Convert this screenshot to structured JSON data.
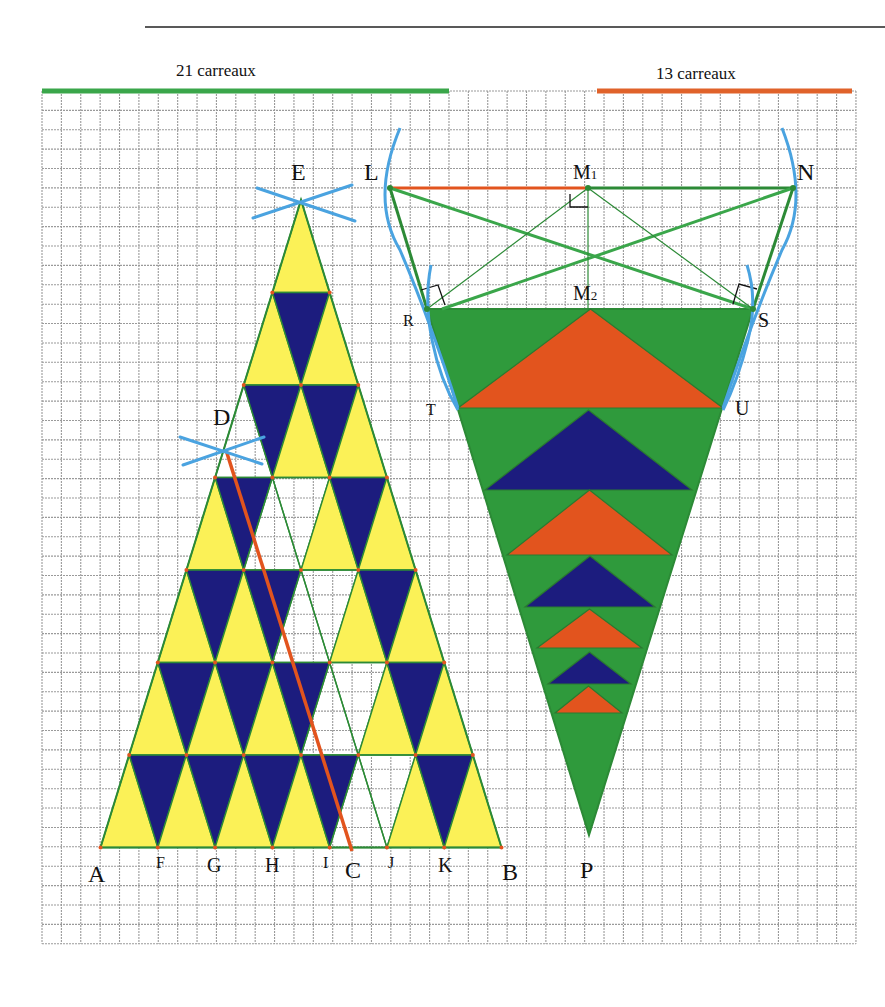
{
  "header": {
    "rule": {
      "x1": 145,
      "x2": 885,
      "y": 27
    },
    "scales": [
      {
        "label": "21 carreaux",
        "x1": 42,
        "x2": 449,
        "y": 91,
        "color": "#3aa64a",
        "label_x": 176,
        "label_y": 70
      },
      {
        "label": "13 carreaux",
        "x1": 597,
        "x2": 852,
        "y": 91,
        "color": "#e0622a",
        "label_x": 656,
        "label_y": 73
      }
    ]
  },
  "grid": {
    "x0": 42,
    "y0": 91,
    "cols": 42,
    "rows": 44,
    "cell": 19.38,
    "color": "#9a9a9a"
  },
  "colors": {
    "yellow": "#fbf157",
    "navy": "#1c1c7e",
    "green_fill": "#2f9a3c",
    "green_line": "#2c8a36",
    "orange": "#e2541e",
    "blue_arc": "#4aa3e0",
    "black": "#111111"
  },
  "left_figure": {
    "apex": {
      "x": 301,
      "y": 200
    },
    "row_height": 92.5,
    "half_step": 28.64,
    "rows": 7,
    "white_up": [
      [
        3,
        0
      ],
      [
        4,
        1
      ],
      [
        5,
        2
      ],
      [
        6,
        3
      ],
      [
        7,
        4
      ]
    ],
    "white_down": [
      [
        4,
        1
      ],
      [
        5,
        2
      ],
      [
        6,
        3
      ],
      [
        7,
        4
      ]
    ],
    "orange_line": {
      "x1": 226,
      "y1": 450,
      "x2": 352,
      "y2": 851
    },
    "arcs_E": [
      {
        "x1": 253,
        "y1": 218,
        "x2": 352,
        "y2": 185
      },
      {
        "x1": 257,
        "y1": 188,
        "x2": 355,
        "y2": 221
      }
    ],
    "arcs_D": [
      {
        "x1": 183,
        "y1": 465,
        "x2": 264,
        "y2": 437
      },
      {
        "x1": 180,
        "y1": 437,
        "x2": 262,
        "y2": 464
      }
    ]
  },
  "right_figure": {
    "L": {
      "x": 390,
      "y": 188
    },
    "M1": {
      "x": 588,
      "y": 188
    },
    "N": {
      "x": 793,
      "y": 188
    },
    "R": {
      "x": 427,
      "y": 309
    },
    "M2": {
      "x": 588,
      "y": 309
    },
    "S": {
      "x": 753,
      "y": 309
    },
    "T": {
      "x": 458,
      "y": 408
    },
    "U": {
      "x": 723,
      "y": 408
    },
    "P": {
      "x": 589,
      "y": 835
    },
    "inner_triangles": [
      {
        "apex_y": 309,
        "base_y": 408,
        "x1": 458,
        "x2": 723,
        "color": "orange"
      },
      {
        "apex_y": 410,
        "base_y": 490,
        "x1": 485,
        "x2": 692,
        "color": "navy"
      },
      {
        "apex_y": 490,
        "base_y": 555,
        "x1": 507,
        "x2": 672,
        "color": "orange"
      },
      {
        "apex_y": 556,
        "base_y": 607,
        "x1": 525,
        "x2": 655,
        "color": "navy"
      },
      {
        "apex_y": 609,
        "base_y": 648,
        "x1": 537,
        "x2": 642,
        "color": "orange"
      },
      {
        "apex_y": 652,
        "base_y": 684,
        "x1": 548,
        "x2": 631,
        "color": "navy"
      },
      {
        "apex_y": 686,
        "base_y": 713,
        "x1": 555,
        "x2": 622,
        "color": "orange"
      }
    ]
  },
  "labels": [
    {
      "id": "E",
      "text": "E",
      "x": 291,
      "y": 160,
      "size": "big"
    },
    {
      "id": "L",
      "text": "L",
      "x": 364,
      "y": 160,
      "size": "big"
    },
    {
      "id": "M1",
      "text": "M",
      "sub": "1",
      "x": 573,
      "y": 162,
      "size": "mid"
    },
    {
      "id": "N",
      "text": "N",
      "x": 797,
      "y": 160,
      "size": "big"
    },
    {
      "id": "M2",
      "text": "M",
      "sub": "2",
      "x": 573,
      "y": 283,
      "size": "mid"
    },
    {
      "id": "R",
      "text": "R",
      "x": 403,
      "y": 313,
      "size": "cap"
    },
    {
      "id": "S",
      "text": "S",
      "x": 758,
      "y": 310,
      "size": "mid"
    },
    {
      "id": "T",
      "text": "T",
      "x": 426,
      "y": 402,
      "size": "cap"
    },
    {
      "id": "U",
      "text": "U",
      "x": 735,
      "y": 398,
      "size": "mid"
    },
    {
      "id": "D",
      "text": "D",
      "x": 213,
      "y": 405,
      "size": "big"
    },
    {
      "id": "A",
      "text": "A",
      "x": 88,
      "y": 862,
      "size": "big"
    },
    {
      "id": "F",
      "text": "F",
      "x": 156,
      "y": 855,
      "size": "cap"
    },
    {
      "id": "G",
      "text": "G",
      "x": 207,
      "y": 855,
      "size": "mid"
    },
    {
      "id": "H",
      "text": "H",
      "x": 265,
      "y": 855,
      "size": "mid"
    },
    {
      "id": "I",
      "text": "I",
      "x": 323,
      "y": 855,
      "size": "cap"
    },
    {
      "id": "C",
      "text": "C",
      "x": 345,
      "y": 858,
      "size": "big"
    },
    {
      "id": "J",
      "text": "J",
      "x": 388,
      "y": 855,
      "size": "cap"
    },
    {
      "id": "K",
      "text": "K",
      "x": 438,
      "y": 855,
      "size": "mid"
    },
    {
      "id": "B",
      "text": "B",
      "x": 502,
      "y": 860,
      "size": "big"
    },
    {
      "id": "P",
      "text": "P",
      "x": 580,
      "y": 858,
      "size": "big"
    }
  ]
}
